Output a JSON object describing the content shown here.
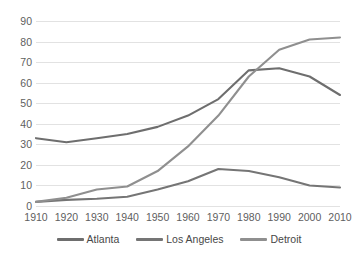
{
  "chart_data": {
    "type": "line",
    "title": "",
    "subtitle": "",
    "xlabel": "",
    "ylabel": "",
    "x": [
      1910,
      1920,
      1930,
      1940,
      1950,
      1960,
      1970,
      1980,
      1990,
      2000,
      2010
    ],
    "categories": [
      "1910",
      "1920",
      "1930",
      "1940",
      "1950",
      "1960",
      "1970",
      "1980",
      "1990",
      "2000",
      "2010"
    ],
    "xlim": [
      1910,
      2010
    ],
    "ylim": [
      0,
      90
    ],
    "y_ticks": [
      0,
      10,
      20,
      30,
      40,
      50,
      60,
      70,
      80,
      90
    ],
    "y_tick_labels": [
      "0",
      "10",
      "20",
      "30",
      "40",
      "50",
      "60",
      "70",
      "80",
      "90"
    ],
    "grid": "horizontal",
    "legend_position": "bottom",
    "series": [
      {
        "name": "Atlanta",
        "color": "#6e6e6e",
        "values": [
          33,
          31,
          33,
          35,
          38.5,
          44,
          52,
          66,
          67,
          63,
          54
        ]
      },
      {
        "name": "Los Angeles",
        "color": "#757575",
        "values": [
          2,
          3,
          3.5,
          4.5,
          8,
          12,
          18,
          17,
          14,
          10,
          9
        ]
      },
      {
        "name": "Detroit",
        "color": "#8f8f8f",
        "values": [
          2,
          4,
          8,
          9.5,
          17,
          29,
          44,
          63,
          76,
          81,
          82
        ]
      }
    ]
  },
  "colors": {
    "background": "#ffffff",
    "gridline": "#e2e2e2",
    "tick_text": "#606060",
    "legend_text": "#474747"
  }
}
